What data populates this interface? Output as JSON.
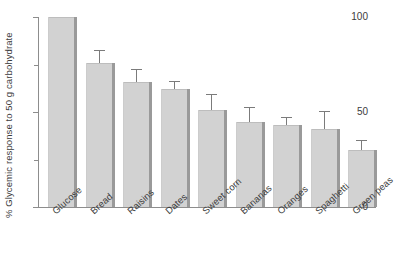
{
  "chart_data": {
    "type": "bar",
    "title": "",
    "xlabel": "",
    "ylabel": "% Glycemic response to 50 g carbohydrate",
    "ylim": [
      0,
      100
    ],
    "yticks": [
      0,
      50,
      100
    ],
    "ytick_labels": [
      "0",
      "50",
      "100"
    ],
    "yminor_ticks": [
      25,
      75
    ],
    "grid": false,
    "legend": null,
    "categories": [
      "Glucose",
      "Bread",
      "Raisins",
      "Dates",
      "Sweet corn",
      "Bananas",
      "Oranges",
      "Spaghetti",
      "Green peas"
    ],
    "values": [
      100,
      76,
      66,
      62,
      51,
      45,
      43,
      41,
      30
    ],
    "errors": [
      0,
      6,
      6,
      4,
      8,
      7,
      4,
      9,
      5
    ],
    "series": [
      {
        "name": "Glycemic index",
        "values": [
          100,
          76,
          66,
          62,
          51,
          45,
          43,
          41,
          30
        ],
        "errors": [
          0,
          6,
          6,
          4,
          8,
          7,
          4,
          9,
          5
        ]
      }
    ],
    "bar_color": "#d2d2d2",
    "error_bar_color": "#7b7b7b",
    "axis_color": "#8d8d8d"
  }
}
